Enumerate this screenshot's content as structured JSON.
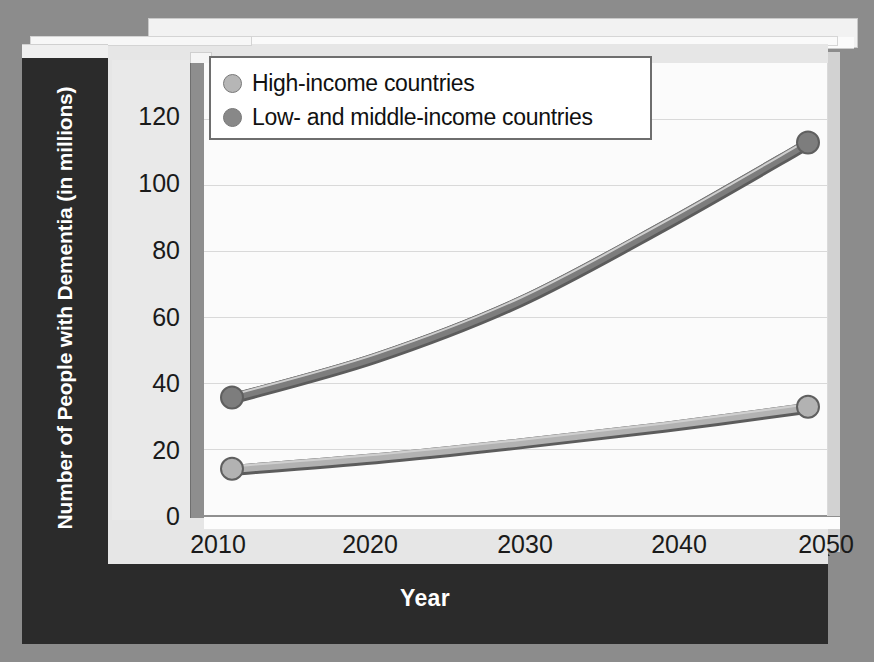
{
  "chart_data": {
    "type": "line",
    "title": "",
    "xlabel": "Year",
    "ylabel": "Number of People with Dementia (in millions)",
    "x": [
      2010,
      2020,
      2030,
      2040,
      2050
    ],
    "xtick_labels": [
      "2010",
      "2020",
      "2030",
      "2040",
      "2050"
    ],
    "ytick_labels": [
      "0",
      "20",
      "40",
      "60",
      "80",
      "100",
      "120"
    ],
    "yticks": [
      0,
      20,
      40,
      60,
      80,
      100,
      120
    ],
    "ylim": [
      0,
      128
    ],
    "xlim": [
      2010,
      2050
    ],
    "grid": true,
    "legend_position": "top-left-inside",
    "series": [
      {
        "name": "High-income countries",
        "color": "#b2b2b2",
        "values": [
          14,
          17.5,
          22,
          27,
          32.8
        ]
      },
      {
        "name": "Low- and middle-income countries",
        "color": "#7d7d7d",
        "values": [
          35.6,
          48,
          65,
          88,
          112.9
        ]
      }
    ]
  },
  "axes": {
    "y_title": "Number of People with Dementia (in millions)",
    "x_title": "Year",
    "y_ticks": [
      "120",
      "100",
      "80",
      "60",
      "40",
      "20",
      "0"
    ],
    "x_ticks": [
      "2010",
      "2020",
      "2030",
      "2040",
      "2050"
    ]
  },
  "legend": {
    "items": [
      {
        "label": "High-income countries",
        "swatch": "#b6b6b6"
      },
      {
        "label": "Low- and middle-income countries",
        "swatch": "#888888"
      }
    ]
  },
  "colors": {
    "page_background": "#8c8c8c",
    "slab_dark": "#2b2b2b",
    "board": "#e6e6e6",
    "plot_background": "#fbfbfb",
    "gridline": "#d9d9d9",
    "wall_face": "#8e8e8e",
    "series_high_income": "#b2b2b2",
    "series_low_middle_income": "#7d7d7d",
    "marker_stroke": "#5f5f5f",
    "axis_text": "#1a1a1a",
    "title_text": "#ffffff"
  }
}
